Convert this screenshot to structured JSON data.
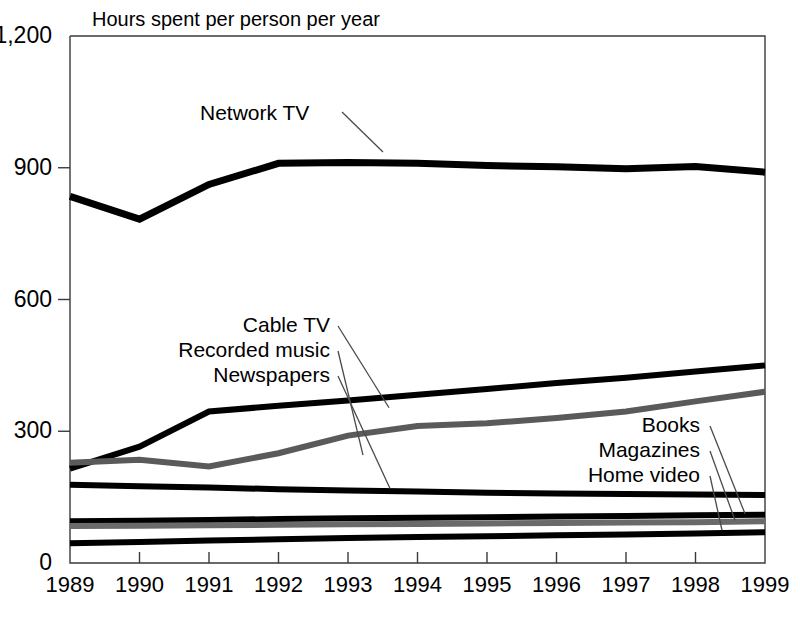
{
  "chart_data": {
    "type": "line",
    "title": "Hours spent per person per year",
    "xlabel": "",
    "ylabel": "",
    "x": [
      1989,
      1990,
      1991,
      1992,
      1993,
      1994,
      1995,
      1996,
      1997,
      1998,
      1999
    ],
    "xtick_labels": [
      "1989",
      "1990",
      "1991",
      "1992",
      "1993",
      "1994",
      "1995",
      "1996",
      "1997",
      "1998",
      "1999"
    ],
    "ytick_labels": [
      "0",
      "300",
      "600",
      "900",
      "1,200"
    ],
    "yticks": [
      0,
      300,
      600,
      900,
      1200
    ],
    "ylim": [
      0,
      1200
    ],
    "xlim": [
      1989,
      1999
    ],
    "grid": false,
    "legend_position": "inline-annotations",
    "series": [
      {
        "name": "Network TV",
        "color": "#000000",
        "width": 7,
        "values": [
          835,
          783,
          862,
          910,
          912,
          910,
          905,
          902,
          898,
          903,
          890
        ]
      },
      {
        "name": "Cable TV",
        "color": "#000000",
        "width": 6,
        "values": [
          215,
          265,
          345,
          358,
          370,
          383,
          396,
          410,
          422,
          436,
          450
        ]
      },
      {
        "name": "Recorded music",
        "color": "#5a5a5a",
        "width": 6,
        "values": [
          228,
          235,
          220,
          250,
          290,
          312,
          318,
          330,
          345,
          368,
          390
        ]
      },
      {
        "name": "Newspapers",
        "color": "#000000",
        "width": 6,
        "values": [
          178,
          175,
          172,
          168,
          165,
          163,
          160,
          158,
          157,
          156,
          155
        ]
      },
      {
        "name": "Books",
        "color": "#000000",
        "width": 6,
        "values": [
          95,
          96,
          98,
          100,
          102,
          103,
          104,
          106,
          107,
          109,
          110
        ]
      },
      {
        "name": "Magazines",
        "color": "#6a6a6a",
        "width": 6,
        "values": [
          84,
          85,
          86,
          87,
          88,
          89,
          90,
          91,
          92,
          93,
          95
        ]
      },
      {
        "name": "Home video",
        "color": "#000000",
        "width": 6,
        "values": [
          45,
          48,
          51,
          54,
          57,
          59,
          61,
          63,
          65,
          67,
          70
        ]
      }
    ],
    "annotations": [
      {
        "text": "Network TV",
        "x": 200,
        "y": 120,
        "align": "start"
      },
      {
        "text": "Cable TV",
        "x": 330,
        "y": 332,
        "align": "end"
      },
      {
        "text": "Recorded music",
        "x": 330,
        "y": 357,
        "align": "end"
      },
      {
        "text": "Newspapers",
        "x": 330,
        "y": 382,
        "align": "end"
      },
      {
        "text": "Books",
        "x": 700,
        "y": 432,
        "align": "end"
      },
      {
        "text": "Magazines",
        "x": 700,
        "y": 457,
        "align": "end"
      },
      {
        "text": "Home video",
        "x": 700,
        "y": 482,
        "align": "end"
      }
    ],
    "caption": ""
  }
}
